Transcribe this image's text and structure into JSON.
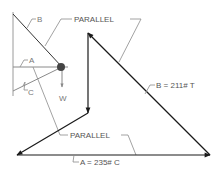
{
  "diagram": {
    "type": "force-vector-polygon",
    "colors": {
      "vector": "#1a1a1a",
      "leader": "#8a8a8a",
      "text": "#666666",
      "wall": "#9a9a9a"
    },
    "free_body": {
      "labels": {
        "b": "B",
        "a": "A",
        "c": "C",
        "w": "W"
      }
    },
    "leaders": {
      "parallel_top": "PARALLEL",
      "parallel_bottom": "PARALLEL"
    },
    "results": {
      "b": "B = 211# T",
      "a": "A = 235# C"
    }
  }
}
